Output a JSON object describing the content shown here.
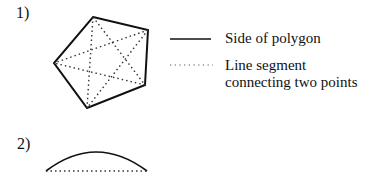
{
  "figure1": {
    "label": "1)"
  },
  "figure2": {
    "label": "2)"
  },
  "legend": {
    "solid": "Side of polygon",
    "dotted_line1": "Line segment",
    "dotted_line2": "connecting two points"
  }
}
